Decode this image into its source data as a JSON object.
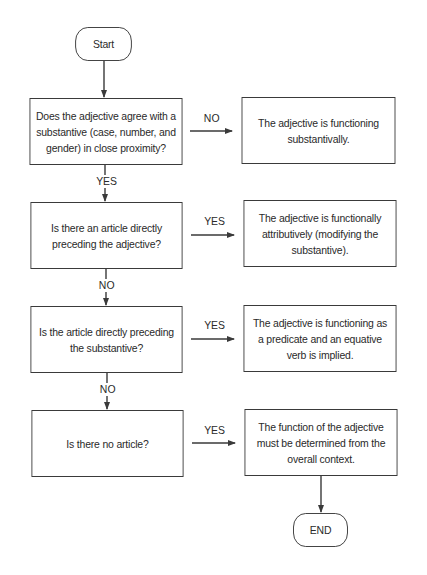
{
  "diagram": {
    "type": "flowchart",
    "start": {
      "label": "Start"
    },
    "end": {
      "label": "END"
    },
    "questions": [
      {
        "text": "Does the adjective agree with a substantive (case, number, and gender) in close proximity?"
      },
      {
        "text": "Is there an article directly preceding the adjective?"
      },
      {
        "text": "Is the article directly preceding the substantive?"
      },
      {
        "text": "Is there no article?"
      }
    ],
    "results": [
      {
        "text": "The adjective is functioning substantivally."
      },
      {
        "text": "The adjective is functionally attributively (modifying the substantive)."
      },
      {
        "text": "The adjective is functioning as a predicate and an equative verb is implied."
      },
      {
        "text": "The function of the adjective must be determined from the overall context."
      }
    ],
    "edge_labels": {
      "q1_to_r1": "NO",
      "q1_to_q2": "YES",
      "q2_to_r2": "YES",
      "q2_to_q3": "NO",
      "q3_to_r3": "YES",
      "q3_to_q4": "NO",
      "q4_to_r4": "YES"
    },
    "colors": {
      "stroke": "#3a3a3a",
      "text": "#2a2a2a",
      "background": "#ffffff"
    }
  }
}
